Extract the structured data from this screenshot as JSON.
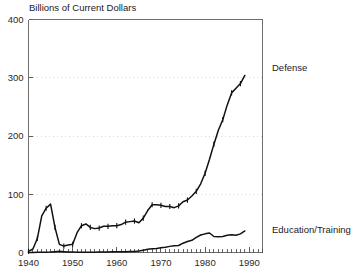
{
  "chart_data": {
    "type": "line",
    "title": "Billions of Current Dollars",
    "xlabel": "",
    "ylabel": "",
    "xlim": [
      1940,
      1993
    ],
    "ylim": [
      0,
      400
    ],
    "yticks": [
      0,
      100,
      200,
      300,
      400
    ],
    "ytick_labels": [
      "0",
      "100",
      "200",
      "300",
      "400"
    ],
    "xticks": [
      1940,
      1950,
      1960,
      1970,
      1980,
      1990
    ],
    "xtick_labels": [
      "1940",
      "1950",
      "1960",
      "1970",
      "1980",
      "1990"
    ],
    "xminor_step": 1,
    "grid": "horizontal-dotted",
    "legend_position": "right-inline",
    "series": [
      {
        "name": "Defense",
        "label": "Defense",
        "color": "#121212",
        "marker": "vertical-tick",
        "x": [
          1940,
          1941,
          1942,
          1943,
          1944,
          1945,
          1946,
          1947,
          1948,
          1949,
          1950,
          1951,
          1952,
          1953,
          1954,
          1955,
          1956,
          1957,
          1958,
          1959,
          1960,
          1961,
          1962,
          1963,
          1964,
          1965,
          1966,
          1967,
          1968,
          1969,
          1970,
          1971,
          1972,
          1973,
          1974,
          1975,
          1976,
          1977,
          1978,
          1979,
          1980,
          1981,
          1982,
          1983,
          1984,
          1985,
          1986,
          1987,
          1988,
          1989
        ],
        "values": [
          2,
          6,
          24,
          63,
          76,
          83,
          43,
          14,
          11,
          13,
          14,
          34,
          46,
          49,
          43,
          41,
          42,
          45,
          45,
          46,
          46,
          48,
          52,
          53,
          54,
          51,
          59,
          72,
          82,
          82,
          81,
          79,
          79,
          77,
          80,
          87,
          90,
          97,
          105,
          118,
          136,
          160,
          186,
          210,
          228,
          253,
          274,
          282,
          290,
          304
        ]
      },
      {
        "name": "Education/Training",
        "label": "Education/Training",
        "color": "#121212",
        "marker": "none",
        "x": [
          1940,
          1941,
          1942,
          1943,
          1944,
          1945,
          1946,
          1947,
          1948,
          1949,
          1950,
          1951,
          1952,
          1953,
          1954,
          1955,
          1956,
          1957,
          1958,
          1959,
          1960,
          1961,
          1962,
          1963,
          1964,
          1965,
          1966,
          1967,
          1968,
          1969,
          1970,
          1971,
          1972,
          1973,
          1974,
          1975,
          1976,
          1977,
          1978,
          1979,
          1980,
          1981,
          1982,
          1983,
          1984,
          1985,
          1986,
          1987,
          1988,
          1989
        ],
        "values": [
          0.1,
          0.2,
          0.3,
          0.4,
          0.5,
          0.8,
          1.5,
          2.0,
          1.5,
          1.0,
          0.8,
          0.5,
          0.4,
          0.5,
          0.5,
          0.6,
          0.7,
          0.8,
          0.9,
          1.1,
          1.2,
          1.3,
          1.5,
          1.6,
          1.8,
          2.5,
          4.0,
          5.5,
          6.5,
          6.8,
          8.0,
          9.0,
          10.5,
          11.5,
          12.0,
          16.0,
          19.0,
          21.0,
          26.0,
          30.0,
          32.0,
          33.5,
          27.5,
          27.0,
          27.5,
          29.5,
          30.5,
          29.5,
          32.0,
          37.0
        ]
      }
    ],
    "annotations": [
      {
        "text": "Defense",
        "anchor_year": 1993,
        "anchor_value": 300
      },
      {
        "text": "Education/Training",
        "anchor_year": 1993,
        "anchor_value": 30
      }
    ]
  },
  "labels": {
    "title": "Billions of Current Dollars",
    "defense": "Defense",
    "education": "Education/Training"
  }
}
